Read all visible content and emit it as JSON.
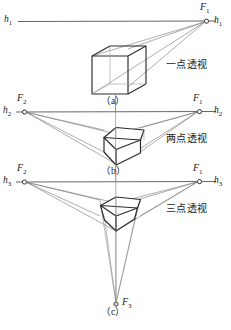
{
  "figure": {
    "stroke_color": "#4a4a4a",
    "cube_color": "#2b2b2b",
    "background": "#ffffff"
  },
  "panels": [
    {
      "id": "a",
      "caption": "（a）",
      "cn_label": "一点透视",
      "horizon_label_left": "h",
      "horizon_label_left_sub": "1",
      "horizon_label_right": "h",
      "horizon_label_right_sub": "1",
      "vanishing_points": [
        {
          "name": "F",
          "sub": "1"
        }
      ]
    },
    {
      "id": "b",
      "caption": "（b）",
      "cn_label": "两点透视",
      "horizon_label_left": "h",
      "horizon_label_left_sub": "2",
      "horizon_label_right": "h",
      "horizon_label_right_sub": "2",
      "vanishing_points": [
        {
          "name": "F",
          "sub": "2"
        },
        {
          "name": "F",
          "sub": "1"
        }
      ]
    },
    {
      "id": "c",
      "caption": "（c）",
      "cn_label": "三点透视",
      "horizon_label_left": "h",
      "horizon_label_left_sub": "3",
      "horizon_label_right": "h",
      "horizon_label_right_sub": "3",
      "vanishing_points": [
        {
          "name": "F",
          "sub": "2"
        },
        {
          "name": "F",
          "sub": "1"
        },
        {
          "name": "F",
          "sub": "3"
        }
      ]
    }
  ],
  "labels": {
    "h1_left": "h",
    "h1_left_sub": "1",
    "h1_right": "h",
    "h1_right_sub": "1",
    "F1_a": "F",
    "F1_a_sub": "1",
    "cn_a": "一点透视",
    "cap_a": "（a）",
    "h2_left": "h",
    "h2_left_sub": "2",
    "h2_right": "h",
    "h2_right_sub": "2",
    "F2_b": "F",
    "F2_b_sub": "2",
    "F1_b": "F",
    "F1_b_sub": "1",
    "cn_b": "两点透视",
    "cap_b": "（b）",
    "h3_left": "h",
    "h3_left_sub": "3",
    "h3_right": "h",
    "h3_right_sub": "3",
    "F2_c": "F",
    "F2_c_sub": "2",
    "F1_c": "F",
    "F1_c_sub": "1",
    "F3_c": "F",
    "F3_c_sub": "3",
    "cn_c": "三点透视",
    "cap_c": "（c）"
  }
}
